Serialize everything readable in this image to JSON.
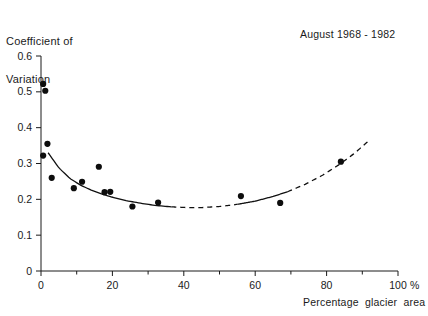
{
  "chart_data": {
    "type": "scatter",
    "title": "Coefficient of Variation",
    "title_lines": [
      "Coefficient of",
      "Variation"
    ],
    "annotation": "August 1968 - 1982",
    "xlabel": "Percentage  glacier  area",
    "ylabel": "Coefficient of Variation",
    "x_unit_label": "%",
    "xlim": [
      0,
      100
    ],
    "ylim": [
      0,
      0.6
    ],
    "xticks": [
      0,
      20,
      40,
      60,
      80,
      100
    ],
    "xtick_labels": [
      "0",
      "20",
      "40",
      "60",
      "80",
      "100"
    ],
    "xminorticks": [
      10,
      30,
      50,
      70,
      90
    ],
    "yticks": [
      0,
      0.1,
      0.2,
      0.3,
      0.4,
      0.5,
      0.6
    ],
    "ytick_labels": [
      "0",
      "0.1",
      "0.2",
      "0.3",
      "0.4",
      "0.5",
      "0.6"
    ],
    "grid": false,
    "legend": null,
    "points": [
      {
        "x": 0.6,
        "y": 0.522
      },
      {
        "x": 1.2,
        "y": 0.503
      },
      {
        "x": 1.8,
        "y": 0.355
      },
      {
        "x": 0.6,
        "y": 0.322
      },
      {
        "x": 3.0,
        "y": 0.26
      },
      {
        "x": 9.2,
        "y": 0.231
      },
      {
        "x": 11.5,
        "y": 0.249
      },
      {
        "x": 16.2,
        "y": 0.291
      },
      {
        "x": 17.8,
        "y": 0.22
      },
      {
        "x": 19.4,
        "y": 0.221
      },
      {
        "x": 25.6,
        "y": 0.18
      },
      {
        "x": 32.8,
        "y": 0.191
      },
      {
        "x": 56.0,
        "y": 0.209
      },
      {
        "x": 67.0,
        "y": 0.19
      },
      {
        "x": 84.0,
        "y": 0.305
      }
    ],
    "fit_curve": {
      "description": "fitted U-shaped curve, solid where data dense, dashed by extrapolation",
      "solid_segments": [
        [
          2.0,
          36.5
        ],
        [
          55.0,
          69.0
        ]
      ],
      "dashed_segments": [
        [
          36.5,
          55.0
        ],
        [
          69.0,
          92.0
        ]
      ],
      "curve_points": [
        {
          "x": 2.0,
          "y": 0.33
        },
        {
          "x": 5.0,
          "y": 0.288
        },
        {
          "x": 8.0,
          "y": 0.259
        },
        {
          "x": 11.0,
          "y": 0.24
        },
        {
          "x": 14.0,
          "y": 0.226
        },
        {
          "x": 17.0,
          "y": 0.215
        },
        {
          "x": 20.0,
          "y": 0.206
        },
        {
          "x": 24.0,
          "y": 0.196
        },
        {
          "x": 28.0,
          "y": 0.189
        },
        {
          "x": 32.0,
          "y": 0.183
        },
        {
          "x": 36.5,
          "y": 0.179
        },
        {
          "x": 41.0,
          "y": 0.177
        },
        {
          "x": 45.0,
          "y": 0.177
        },
        {
          "x": 50.0,
          "y": 0.18
        },
        {
          "x": 55.0,
          "y": 0.186
        },
        {
          "x": 60.0,
          "y": 0.195
        },
        {
          "x": 65.0,
          "y": 0.208
        },
        {
          "x": 69.0,
          "y": 0.221
        },
        {
          "x": 74.0,
          "y": 0.242
        },
        {
          "x": 79.0,
          "y": 0.268
        },
        {
          "x": 84.0,
          "y": 0.3
        },
        {
          "x": 88.0,
          "y": 0.33
        },
        {
          "x": 92.0,
          "y": 0.365
        }
      ]
    }
  }
}
